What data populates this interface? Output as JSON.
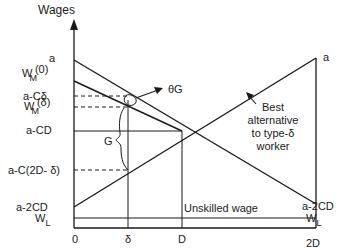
{
  "axes": {
    "y_label": "Wages",
    "x_ticks": [
      "0",
      "δ",
      "D",
      "2D"
    ]
  },
  "left_labels": {
    "a": "a",
    "wm0_main": "W",
    "wm0_sub": "M",
    "wm0_arg": "(0)",
    "a_cdelta": "a-Cδ",
    "wmd_main": "W",
    "wmd_sub": "M",
    "wmd_arg": "(δ)",
    "a_cd": "a-CD",
    "a_c2d": "a-C(2D- δ)",
    "a_2cd": "a-2CD",
    "wl_main": "W",
    "wl_sub": "L"
  },
  "right_labels": {
    "a": "a",
    "a_2cd": "a-2CD",
    "wl_main": "W",
    "wl_sub": "L"
  },
  "annotations": {
    "theta_g": "θG",
    "g": "G",
    "best_alt_line1": "Best",
    "best_alt_line2": "alternative",
    "best_alt_line3": "to type-δ",
    "best_alt_line4": "worker",
    "unskilled": "Unskilled wage"
  }
}
